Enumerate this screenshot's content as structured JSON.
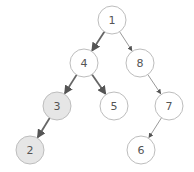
{
  "diagram": {
    "type": "binary-tree",
    "colors": {
      "background": "#ffffff",
      "node_stroke": "#bdbdbd",
      "node_fill": "#ffffff",
      "highlight_fill": "#e6e6e6",
      "strong_edge": "#666666",
      "light_edge": "#9a9a9a",
      "label": "#555555"
    },
    "node_radius": 14,
    "nodes": [
      {
        "id": "n1",
        "label": "1",
        "x": 112,
        "y": 20,
        "highlight": false
      },
      {
        "id": "n4",
        "label": "4",
        "x": 84,
        "y": 63,
        "highlight": false
      },
      {
        "id": "n8",
        "label": "8",
        "x": 140,
        "y": 63,
        "highlight": false
      },
      {
        "id": "n3",
        "label": "3",
        "x": 57,
        "y": 106,
        "highlight": true
      },
      {
        "id": "n5",
        "label": "5",
        "x": 114,
        "y": 106,
        "highlight": false
      },
      {
        "id": "n7",
        "label": "7",
        "x": 169,
        "y": 106,
        "highlight": false
      },
      {
        "id": "n2",
        "label": "2",
        "x": 30,
        "y": 150,
        "highlight": true
      },
      {
        "id": "n6",
        "label": "6",
        "x": 141,
        "y": 150,
        "highlight": false
      }
    ],
    "edges": [
      {
        "from": "n1",
        "to": "n4",
        "strong": true
      },
      {
        "from": "n1",
        "to": "n8",
        "strong": false
      },
      {
        "from": "n4",
        "to": "n3",
        "strong": true
      },
      {
        "from": "n4",
        "to": "n5",
        "strong": true
      },
      {
        "from": "n8",
        "to": "n7",
        "strong": false
      },
      {
        "from": "n3",
        "to": "n2",
        "strong": true
      },
      {
        "from": "n7",
        "to": "n6",
        "strong": false
      }
    ]
  }
}
